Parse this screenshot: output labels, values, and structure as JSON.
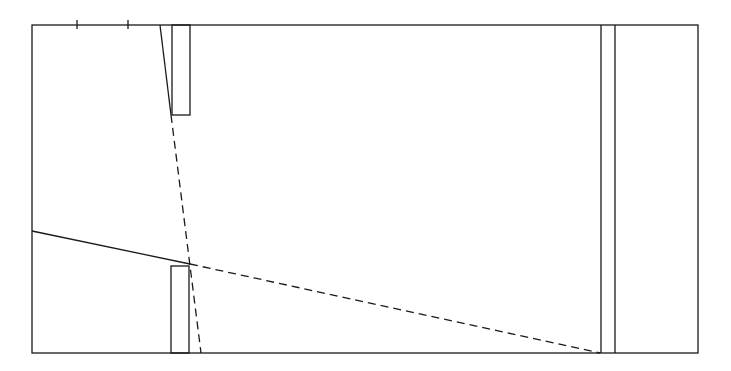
{
  "diagram": {
    "type": "optics-slit-geometry",
    "width": 731,
    "height": 371,
    "stroke_color": "#1a1a1a",
    "background": "#ffffff",
    "frame": {
      "x1": 32,
      "y1": 25,
      "x2": 698,
      "y2": 353
    },
    "top_ticks": [
      77,
      128
    ],
    "top_slit": {
      "slant": [
        160,
        25,
        171,
        115
      ],
      "rect": {
        "x": 172,
        "y": 25,
        "w": 18,
        "h": 90
      }
    },
    "bottom_slit": {
      "rect": {
        "x": 171,
        "y": 266,
        "w": 18,
        "h": 87
      }
    },
    "screen": {
      "x_left": 601,
      "x_right": 615
    },
    "solid_ray": [
      32,
      231,
      190,
      264
    ],
    "dashed_rays": [
      [
        171,
        115,
        201,
        353
      ],
      [
        190,
        264,
        600,
        353
      ]
    ]
  }
}
